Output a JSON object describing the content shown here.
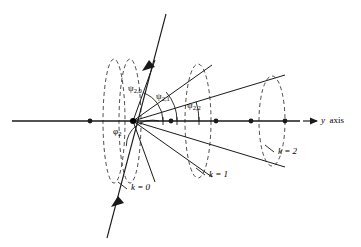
{
  "figure": {
    "kind": "geometry-diagram",
    "background_color": "#ffffff",
    "stroke_color": "#1a1a1a",
    "dashed_color": "#3a3a3a"
  },
  "axis": {
    "name": "y-axis",
    "label_y": "y",
    "label_text": "axis",
    "arrow": "right-arrow-icon",
    "x_start": 12,
    "x_end": 300,
    "y": 121,
    "origin_x": 133,
    "origin_y": 121,
    "tick_dots_x": [
      90,
      171,
      216,
      251,
      285
    ],
    "dot_radius": 2.4
  },
  "slant_line": {
    "name": "phi-reference-line",
    "x1": 166,
    "y1": 14,
    "x2": 107,
    "y2": 238,
    "arrow_upper_at": 0.27,
    "arrow_lower_at": 0.79
  },
  "angles": [
    {
      "id": "psi-2-0",
      "symbol": "ψ",
      "sub": "2,0",
      "label_x": 131,
      "label_y": 90,
      "arc_radius": 30,
      "ray_deg": -70
    },
    {
      "id": "psi-2-1",
      "symbol": "ψ",
      "sub": "2,1",
      "label_x": 159,
      "label_y": 97,
      "arc_radius": 44,
      "ray_deg": -41
    },
    {
      "id": "psi-2-2",
      "symbol": "ψ",
      "sub": "2,2",
      "label_x": 190,
      "label_y": 106,
      "arc_radius": 66,
      "ray_deg": -17
    },
    {
      "id": "phi-2",
      "symbol": "φ",
      "sub": "2",
      "label_x": 115,
      "label_y": 130,
      "arc_radius": 26,
      "ray_deg": 105
    }
  ],
  "cones": [
    {
      "id": "cone-k0",
      "label": "k = 0",
      "label_x": 130,
      "label_y": 188,
      "leader": {
        "x1": 127,
        "y1": 189,
        "x2": 117,
        "y2": 182
      },
      "half_angle_deg": 70,
      "base_center_x": 130,
      "base_rx": 11,
      "base_ry": 62,
      "dashed": true
    },
    {
      "id": "cone-k1",
      "label": "k = 1",
      "label_x": 208,
      "label_y": 175,
      "leader": {
        "x1": 205,
        "y1": 175,
        "x2": 195,
        "y2": 169
      },
      "half_angle_deg": 41,
      "base_center_x": 198,
      "base_rx": 13,
      "base_ry": 57,
      "dashed": true
    },
    {
      "id": "cone-k2",
      "label": "k = 2",
      "label_x": 277,
      "label_y": 152,
      "leader": {
        "x1": 274,
        "y1": 152,
        "x2": 265,
        "y2": 146
      },
      "half_angle_deg": 17,
      "base_center_x": 272,
      "base_rx": 13,
      "base_ry": 45,
      "dashed": true
    }
  ],
  "extra_ellipse": {
    "id": "ellipse-inner-k0",
    "center_x": 114,
    "rx": 11,
    "ry": 62,
    "dashed": true
  }
}
